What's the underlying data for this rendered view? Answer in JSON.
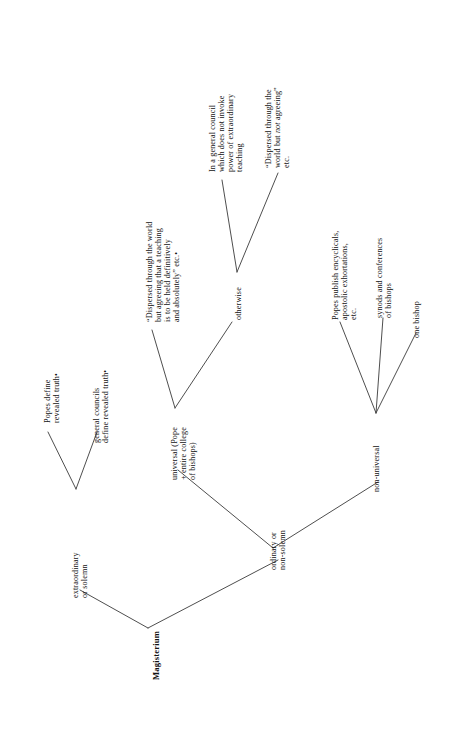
{
  "diagram": {
    "title": "Magisterium",
    "type": "tree-diagram",
    "orientation": "rotated-90-counterclockwise",
    "background_color": "#ffffff",
    "line_color": "#3a3a3a",
    "text_color": "#111111",
    "nodes": {
      "root": {
        "lines": [
          "Magisterium"
        ],
        "bold": true
      },
      "extraordinary": {
        "lines": [
          "extraordinary",
          "or solemn"
        ]
      },
      "popes_define": {
        "lines": [
          "Popes define",
          "revealed truth•"
        ]
      },
      "general_councils": {
        "lines": [
          "general councils",
          "define revealed truth•"
        ]
      },
      "ordinary": {
        "lines": [
          "ordinary or",
          "non-solemn"
        ]
      },
      "universal": {
        "lines": [
          "universal (Pope",
          "+ entire college",
          "of bishops)"
        ]
      },
      "dispersed_agreeing": {
        "lines": [
          "“Dispersed through the world",
          "but agreeing that a teaching",
          "is to be held definitively",
          "and absolutely” etc.•"
        ]
      },
      "otherwise": {
        "lines": [
          "otherwise"
        ]
      },
      "general_council_not_invoke": {
        "lines": [
          "In a general council",
          "which does not invoke",
          "power of extraordinary",
          "teaching"
        ]
      },
      "dispersed_not_agreeing": {
        "lines_rich": [
          [
            {
              "t": "“Dispersed through the"
            }
          ],
          [
            {
              "t": "world but "
            },
            {
              "t": "not",
              "style": "italic"
            },
            {
              "t": " agreeing”"
            }
          ],
          [
            {
              "t": "etc."
            }
          ]
        ]
      },
      "non_universal": {
        "lines": [
          "non-universal"
        ]
      },
      "popes_publish": {
        "lines": [
          "Popes publish encyclicals,",
          "apostolic exhortations,",
          "etc."
        ]
      },
      "synods": {
        "lines": [
          "synods and conferences",
          "of bishops"
        ]
      },
      "one_bishop": {
        "lines": [
          "one bishop"
        ]
      }
    },
    "edges": [
      {
        "from": "root",
        "to": "extraordinary"
      },
      {
        "from": "root",
        "to": "ordinary"
      },
      {
        "from": "extraordinary",
        "to": "popes_define"
      },
      {
        "from": "extraordinary",
        "to": "general_councils"
      },
      {
        "from": "ordinary",
        "to": "universal"
      },
      {
        "from": "ordinary",
        "to": "non_universal"
      },
      {
        "from": "universal",
        "to": "dispersed_agreeing"
      },
      {
        "from": "universal",
        "to": "otherwise"
      },
      {
        "from": "otherwise",
        "to": "general_council_not_invoke"
      },
      {
        "from": "otherwise",
        "to": "dispersed_not_agreeing"
      },
      {
        "from": "non_universal",
        "to": "popes_publish"
      },
      {
        "from": "non_universal",
        "to": "synods"
      },
      {
        "from": "non_universal",
        "to": "one_bishop"
      }
    ]
  }
}
